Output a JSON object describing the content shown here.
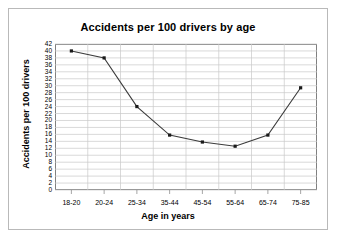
{
  "chart_data": {
    "type": "line",
    "title": "Accidents per 100 drivers by age",
    "xlabel": "Age in years",
    "ylabel": "Accidents per 100 drivers",
    "categories": [
      "18-20",
      "20-24",
      "25-34",
      "35-44",
      "45-54",
      "55-64",
      "65-74",
      "75-85"
    ],
    "values": [
      40,
      38,
      24,
      15.8,
      13.8,
      12.6,
      15.8,
      29.4
    ],
    "ylim": [
      0,
      42
    ],
    "ytick_step": 2,
    "yticks": [
      0,
      2,
      4,
      6,
      8,
      10,
      12,
      14,
      16,
      18,
      20,
      22,
      24,
      26,
      28,
      30,
      32,
      34,
      36,
      38,
      40,
      42
    ],
    "grid": "both",
    "legend": "none",
    "series_color": "#3b3b3b",
    "marker": "square",
    "gridline_color": "#c8c8c8",
    "axis_color": "#808080"
  }
}
